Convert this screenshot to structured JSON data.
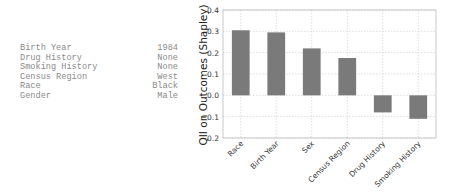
{
  "attributes": [
    {
      "name": "Birth Year",
      "value": "1984"
    },
    {
      "name": "Drug History",
      "value": "None"
    },
    {
      "name": "Smoking History",
      "value": "None"
    },
    {
      "name": "Census Region",
      "value": "West"
    },
    {
      "name": "Race",
      "value": "Black"
    },
    {
      "name": "Gender",
      "value": "Male"
    }
  ],
  "chart_data": {
    "type": "bar",
    "title": "",
    "xlabel": "",
    "ylabel": "QII on Outcomes (Shapley)",
    "categories": [
      "Race",
      "Birth Year",
      "Sex",
      "Census Region",
      "Drug History",
      "Smoking History"
    ],
    "values": [
      0.305,
      0.295,
      0.22,
      0.175,
      -0.08,
      -0.11
    ],
    "ylim": [
      -0.2,
      0.4
    ],
    "yticks": [
      0.4,
      0.3,
      0.2,
      0.1,
      0.0,
      -0.1,
      -0.2
    ],
    "ytick_labels": [
      "0.4",
      "0.3",
      "0.2",
      "0.1",
      "0.0",
      "−0.1",
      "−0.2"
    ],
    "grid": true,
    "bar_color": "#7a7a7a",
    "legend": null
  }
}
